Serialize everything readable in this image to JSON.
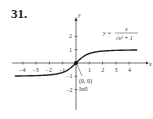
{
  "problem_number": "31.",
  "chart_data": {
    "type": "line",
    "title": "",
    "equation": "y = x / √(x² + 1)",
    "equation_parts": {
      "lhs": "y =",
      "numerator": "x",
      "denominator": "√x² + 1"
    },
    "xlabel": "x",
    "ylabel": "y",
    "xlim": [
      -4.6,
      4.6
    ],
    "ylim": [
      -3,
      3
    ],
    "x_ticks": [
      -4,
      -3,
      -2,
      -1,
      1,
      2,
      3,
      4
    ],
    "x_tick_labels": [
      "−4",
      "−3",
      "−2",
      "−1",
      "1",
      "2",
      "3",
      "4"
    ],
    "y_ticks": [
      -2,
      -1,
      1,
      2
    ],
    "y_tick_labels": [
      "−2",
      "−1",
      "1",
      "2"
    ],
    "grid": false,
    "annotations": [
      {
        "text": "(0, 0)",
        "point": [
          0,
          0
        ]
      },
      {
        "text": "Infl",
        "point": [
          0,
          0
        ]
      }
    ],
    "asymptotes": [
      1,
      -1
    ],
    "series": [
      {
        "name": "y = x/sqrt(x^2+1)",
        "x": [
          -4.6,
          -4,
          -3,
          -2,
          -1,
          -0.5,
          0,
          0.5,
          1,
          2,
          3,
          4,
          4.6
        ],
        "values": [
          -0.977,
          -0.97,
          -0.949,
          -0.894,
          -0.707,
          -0.447,
          0,
          0.447,
          0.707,
          0.894,
          0.949,
          0.97,
          0.977
        ]
      }
    ]
  }
}
